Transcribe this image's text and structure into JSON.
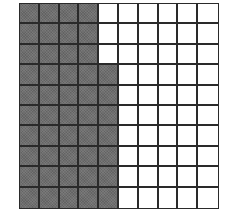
{
  "diagram": {
    "type": "hundred-grid",
    "rows": 10,
    "columns": 10,
    "total_cells": 100,
    "shaded_cells": 47,
    "unshaded_cells": 53,
    "shaded_per_row": [
      4,
      4,
      4,
      5,
      5,
      5,
      5,
      5,
      5,
      5
    ],
    "colors": {
      "shaded": "#6e6e6e",
      "unshaded": "#ffffff",
      "gridline": "#2a2a2a"
    }
  }
}
